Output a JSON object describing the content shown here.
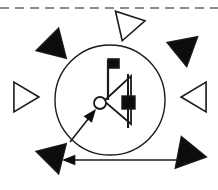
{
  "figure": {
    "canvas": {
      "width": 218,
      "height": 190,
      "background": "#ffffff"
    },
    "colors": {
      "stroke": "#1a1a1a",
      "fill_solid": "#0d0d0d",
      "fill_hollow": "#ffffff",
      "dashed_rule": "#8c8c8c"
    },
    "dashed_rule": {
      "label": "dashed-top-border",
      "y": 8,
      "x_start": 0,
      "x_end": 218,
      "dash_pattern": "9 6",
      "stroke_width": 2
    },
    "main_circle": {
      "label": "central-circle",
      "cx": 110,
      "cy": 100,
      "r": 55,
      "stroke_width": 1.4,
      "fill": "none"
    },
    "markers": [
      {
        "id": "marker-n",
        "name": "triangle-marker-north",
        "style": "hollow",
        "x": 127,
        "y": 26,
        "rotation": 108,
        "size": 25
      },
      {
        "id": "marker-ne",
        "name": "triangle-marker-northeast",
        "style": "solid",
        "x": 182,
        "y": 48,
        "rotation": 200,
        "size": 26
      },
      {
        "id": "marker-e",
        "name": "triangle-marker-east",
        "style": "hollow",
        "x": 196,
        "y": 97,
        "rotation": 180,
        "size": 24
      },
      {
        "id": "marker-se",
        "name": "triangle-marker-southeast",
        "style": "solid",
        "x": 187,
        "y": 152,
        "rotation": 250,
        "size": 27
      },
      {
        "id": "marker-s",
        "name": "triangle-marker-south",
        "style": "none",
        "x": 110,
        "y": 180,
        "rotation": 270,
        "size": 0
      },
      {
        "id": "marker-sw",
        "name": "triangle-marker-southwest",
        "style": "solid",
        "x": 55,
        "y": 155,
        "rotation": 315,
        "size": 26
      },
      {
        "id": "marker-w",
        "name": "triangle-marker-west",
        "style": "hollow",
        "x": 24,
        "y": 97,
        "rotation": 0,
        "size": 24
      },
      {
        "id": "marker-nw",
        "name": "triangle-marker-northwest",
        "style": "solid",
        "x": 55,
        "y": 47,
        "rotation": 45,
        "size": 26
      }
    ],
    "center_group": {
      "flag": {
        "name": "flag-marker",
        "pole_x": 108,
        "pole_top": 60,
        "pole_bottom": 100,
        "banner_w": 11,
        "banner_h": 9,
        "stroke_width": 2.2
      },
      "inner_triangle": {
        "name": "hollow-triangle-pointer",
        "points": "104,101 131,76 131,124",
        "stroke_width": 1.8,
        "fill": "none"
      },
      "small_circle": {
        "name": "small-circle-node",
        "cx": 100,
        "cy": 103,
        "r": 6,
        "stroke_width": 1.8,
        "fill": "#ffffff"
      },
      "solid_square": {
        "name": "solid-square-node",
        "x": 122,
        "y": 96,
        "w": 13,
        "h": 13
      },
      "vertical_bar": {
        "name": "vertical-bar-line",
        "x": 128,
        "y_top": 74,
        "y_bottom": 128,
        "stroke_width": 2
      }
    },
    "arrows": [
      {
        "id": "arrow-diagonal",
        "name": "diagonal-arrow-to-circle",
        "from_x": 70,
        "from_y": 142,
        "to_x": 96,
        "to_y": 109,
        "stroke_width": 1.6,
        "head_size": 7
      },
      {
        "id": "arrow-horizontal",
        "name": "horizontal-arrow-leftward",
        "from_x": 180,
        "from_y": 160,
        "to_x": 62,
        "to_y": 160,
        "stroke_width": 1.6,
        "head_size": 7
      }
    ]
  }
}
